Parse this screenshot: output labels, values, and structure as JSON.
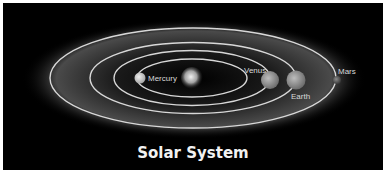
{
  "title": "Solar System",
  "colors": {
    "background": "#000000",
    "orbit": "#d8d8d8",
    "glow": "#5a5a5a",
    "text": "#e6e6e6"
  },
  "sun": {
    "label": ""
  },
  "planets": [
    {
      "name": "Mercury",
      "label": "Mercury"
    },
    {
      "name": "Venus",
      "label": "Venus"
    },
    {
      "name": "Earth",
      "label": "Earth"
    },
    {
      "name": "Mars",
      "label": "Mars"
    }
  ]
}
